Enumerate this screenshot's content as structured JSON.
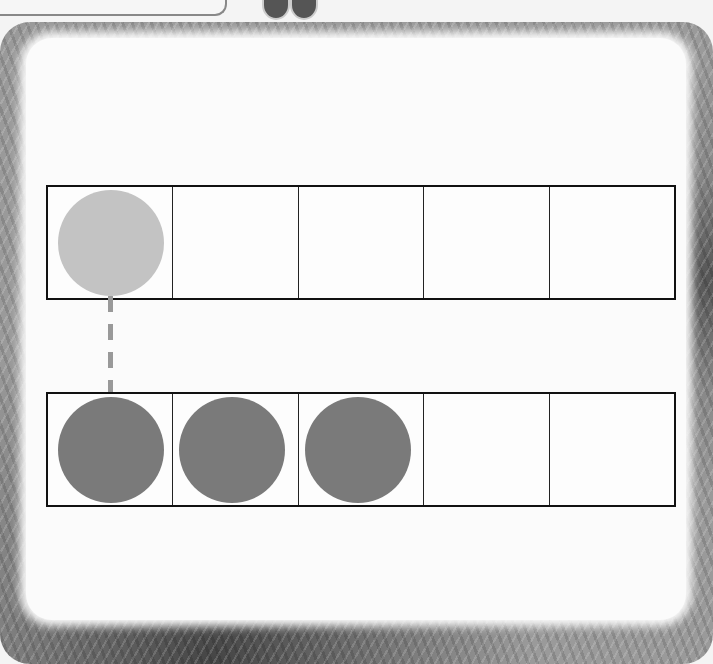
{
  "diagram": {
    "type": "ten-frame comparison",
    "top_frame": {
      "cells": 5,
      "counters": [
        {
          "cell": 0,
          "shade": "light",
          "color": "#c3c3c3"
        }
      ],
      "filled_count": 1
    },
    "bottom_frame": {
      "cells": 5,
      "counters": [
        {
          "cell": 0,
          "shade": "dark",
          "color": "#7a7a7a"
        },
        {
          "cell": 1,
          "shade": "dark",
          "color": "#7a7a7a"
        },
        {
          "cell": 2,
          "shade": "dark",
          "color": "#7a7a7a"
        }
      ],
      "filled_count": 3
    },
    "connector": {
      "style": "dashed",
      "from": "top_frame.cell0",
      "to": "bottom_frame.cell0",
      "color": "#999999"
    },
    "border": "fern-leaf photo frame"
  }
}
